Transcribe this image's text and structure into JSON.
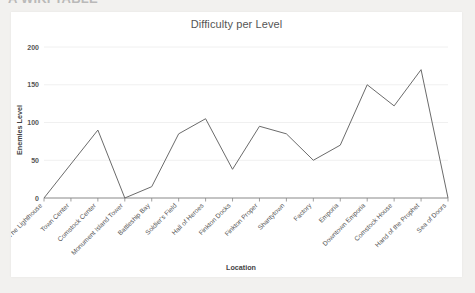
{
  "page": {
    "heading_clipped": "A WIKI TABLE",
    "background_color": "#f2f1ef",
    "card_color": "#ffffff"
  },
  "chart": {
    "title": "Difficulty per Level",
    "line_color": "#6b6b6b",
    "grid_color": "#f0f0f0",
    "axis_color": "#888888"
  },
  "chart_data": {
    "type": "line",
    "title": "Difficulty per Level",
    "xlabel": "Location",
    "ylabel": "Enemies Level",
    "grid": true,
    "legend": "none",
    "ylim": [
      0,
      200
    ],
    "yticks": [
      0,
      50,
      100,
      150,
      200
    ],
    "categories": [
      "The Lighthouse",
      "Town Center",
      "Comstock Center",
      "Monument Island Tower",
      "Battleship Bay",
      "Soldier's Field",
      "Hall of Heroes",
      "Finkton Docks",
      "Finkton Proper",
      "Shantytown",
      "Factory",
      "Emporia",
      "Downtown Emporia",
      "Comstock House",
      "Hand of the Prophet",
      "Sea of Doors"
    ],
    "series": [
      {
        "name": "Enemies Level",
        "values": [
          0,
          45,
          90,
          0,
          15,
          85,
          105,
          38,
          95,
          85,
          50,
          70,
          150,
          122,
          170,
          0
        ]
      }
    ]
  }
}
